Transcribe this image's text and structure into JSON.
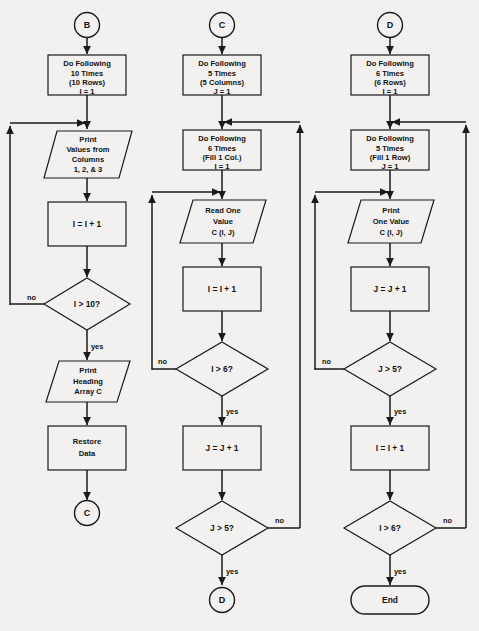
{
  "diagram": {
    "background_color": "#f2f1ef",
    "stroke_color": "#1a1a1a",
    "width": 479,
    "height": 631
  },
  "columns": [
    {
      "id": "column-b",
      "entry_connector": "B",
      "exit_connector": "C",
      "nodes": [
        {
          "id": "b-start-connector",
          "type": "connector",
          "label": "B"
        },
        {
          "id": "b-do-following",
          "type": "process",
          "lines": [
            "Do Following",
            "10 Times",
            "(10 Rows)",
            "I = 1"
          ]
        },
        {
          "id": "b-print-values",
          "type": "io",
          "lines": [
            "Print",
            "Values from",
            "Columns",
            "1, 2, & 3"
          ]
        },
        {
          "id": "b-increment-i",
          "type": "process",
          "lines": [
            "I = I + 1"
          ]
        },
        {
          "id": "b-test-i-gt-10",
          "type": "decision",
          "lines": [
            "I > 10?"
          ],
          "no_label": "no",
          "yes_label": "yes"
        },
        {
          "id": "b-print-heading",
          "type": "io",
          "lines": [
            "Print",
            "Heading",
            "Array C"
          ]
        },
        {
          "id": "b-restore-data",
          "type": "process",
          "lines": [
            "Restore",
            "Data"
          ]
        },
        {
          "id": "b-end-connector",
          "type": "connector",
          "label": "C"
        }
      ]
    },
    {
      "id": "column-c",
      "entry_connector": "C",
      "exit_connector": "D",
      "nodes": [
        {
          "id": "c-start-connector",
          "type": "connector",
          "label": "C"
        },
        {
          "id": "c-do-following-outer",
          "type": "process",
          "lines": [
            "Do Following",
            "5 Times",
            "(5 Columns)",
            "J = 1"
          ]
        },
        {
          "id": "c-do-following-inner",
          "type": "process",
          "lines": [
            "Do Following",
            "6 Times",
            "(Fill 1 Col.)",
            "I = 1"
          ]
        },
        {
          "id": "c-read-one-value",
          "type": "io",
          "lines": [
            "Read One",
            "Value",
            "C (I, J)"
          ]
        },
        {
          "id": "c-increment-i",
          "type": "process",
          "lines": [
            "I = I + 1"
          ]
        },
        {
          "id": "c-test-i-gt-6",
          "type": "decision",
          "lines": [
            "I > 6?"
          ],
          "no_label": "no",
          "yes_label": "yes"
        },
        {
          "id": "c-increment-j",
          "type": "process",
          "lines": [
            "J = J + 1"
          ]
        },
        {
          "id": "c-test-j-gt-5",
          "type": "decision",
          "lines": [
            "J > 5?"
          ],
          "no_label": "no",
          "yes_label": "yes"
        },
        {
          "id": "c-end-connector",
          "type": "connector",
          "label": "D"
        }
      ]
    },
    {
      "id": "column-d",
      "entry_connector": "D",
      "exit_connector": "End",
      "nodes": [
        {
          "id": "d-start-connector",
          "type": "connector",
          "label": "D"
        },
        {
          "id": "d-do-following-outer",
          "type": "process",
          "lines": [
            "Do Following",
            "6 Times",
            "(6 Rows)",
            "I = 1"
          ]
        },
        {
          "id": "d-do-following-inner",
          "type": "process",
          "lines": [
            "Do Following",
            "5 Times",
            "(Fill 1 Row)",
            "J = 1"
          ]
        },
        {
          "id": "d-print-one-value",
          "type": "io",
          "lines": [
            "Print",
            "One Value",
            "C (I, J)"
          ]
        },
        {
          "id": "d-increment-j",
          "type": "process",
          "lines": [
            "J = J + 1"
          ]
        },
        {
          "id": "d-test-j-gt-5",
          "type": "decision",
          "lines": [
            "J > 5?"
          ],
          "no_label": "no",
          "yes_label": "yes"
        },
        {
          "id": "d-increment-i",
          "type": "process",
          "lines": [
            "I = I + 1"
          ]
        },
        {
          "id": "d-test-i-gt-6",
          "type": "decision",
          "lines": [
            "I > 6?"
          ],
          "no_label": "no",
          "yes_label": "yes"
        },
        {
          "id": "d-terminator-end",
          "type": "terminator",
          "lines": [
            "End"
          ]
        }
      ]
    }
  ],
  "text": {
    "col_b": {
      "connector_start": "B",
      "box1_l1": "Do Following",
      "box1_l2": "10 Times",
      "box1_l3": "(10 Rows)",
      "box1_l4": "I = 1",
      "io1_l1": "Print",
      "io1_l2": "Values from",
      "io1_l3": "Columns",
      "io1_l4": "1, 2, & 3",
      "box2_l1": "I = I + 1",
      "dec1": "I > 10?",
      "dec1_no": "no",
      "dec1_yes": "yes",
      "io2_l1": "Print",
      "io2_l2": "Heading",
      "io2_l3": "Array C",
      "box3_l1": "Restore",
      "box3_l2": "Data",
      "connector_end": "C"
    },
    "col_c": {
      "connector_start": "C",
      "box1_l1": "Do Following",
      "box1_l2": "5 Times",
      "box1_l3": "(5 Columns)",
      "box1_l4": "J = 1",
      "box2_l1": "Do Following",
      "box2_l2": "6 Times",
      "box2_l3": "(Fill 1 Col.)",
      "box2_l4": "I = 1",
      "io1_l1": "Read One",
      "io1_l2": "Value",
      "io1_l3": "C (I, J)",
      "box3_l1": "I = I + 1",
      "dec1": "I > 6?",
      "dec1_no": "no",
      "dec1_yes": "yes",
      "box4_l1": "J = J + 1",
      "dec2": "J > 5?",
      "dec2_no": "no",
      "dec2_yes": "yes",
      "connector_end": "D"
    },
    "col_d": {
      "connector_start": "D",
      "box1_l1": "Do Following",
      "box1_l2": "6 Times",
      "box1_l3": "(6 Rows)",
      "box1_l4": "I = 1",
      "box2_l1": "Do Following",
      "box2_l2": "5 Times",
      "box2_l3": "(Fill 1 Row)",
      "box2_l4": "J = 1",
      "io1_l1": "Print",
      "io1_l2": "One Value",
      "io1_l3": "C (I, J)",
      "box3_l1": "J = J + 1",
      "dec1": "J > 5?",
      "dec1_no": "no",
      "dec1_yes": "yes",
      "box4_l1": "I = I + 1",
      "dec2": "I > 6?",
      "dec2_no": "no",
      "dec2_yes": "yes",
      "terminator": "End"
    }
  }
}
